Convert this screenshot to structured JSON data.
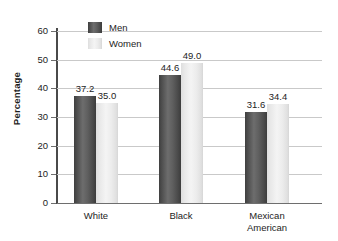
{
  "chart_data": {
    "type": "bar",
    "title": "",
    "xlabel": "",
    "ylabel": "Percentage",
    "categories": [
      "White",
      "Black",
      "Mexican American"
    ],
    "category_lines": [
      [
        "White"
      ],
      [
        "Black"
      ],
      [
        "Mexican",
        "American"
      ]
    ],
    "series": [
      {
        "name": "Men",
        "values": [
          37.2,
          44.6,
          31.6
        ],
        "color": "#4d4d4d"
      },
      {
        "name": "Women",
        "values": [
          35.0,
          49.0,
          34.4
        ],
        "color": "#ececec"
      }
    ],
    "value_labels": {
      "men": [
        "37.2",
        "44.6",
        "31.6"
      ],
      "women": [
        "35.0",
        "49.0",
        "34.4"
      ]
    },
    "ylim": [
      0,
      60
    ],
    "yticks": [
      0,
      10,
      20,
      30,
      40,
      50,
      60
    ],
    "ytick_labels": [
      "0",
      "10",
      "20",
      "30",
      "40",
      "50",
      "60"
    ],
    "grid": true,
    "legend_position": "top-left-inside"
  },
  "legend": {
    "items": [
      {
        "label": "Men"
      },
      {
        "label": "Women"
      }
    ]
  }
}
